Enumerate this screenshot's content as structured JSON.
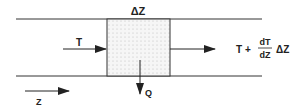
{
  "diagram": {
    "type": "control-volume energy balance",
    "labels": {
      "delta_z": "ΔZ",
      "inflow": "T",
      "outflow_prefix": "T +",
      "outflow_numerator": "dT",
      "outflow_denominator": "dZ",
      "outflow_suffix": "ΔZ",
      "heat_loss": "Q",
      "axis": "Z"
    },
    "colors": {
      "line": "#222222",
      "fill": "#f4f4f4",
      "dots": "#bbbbbb"
    }
  }
}
